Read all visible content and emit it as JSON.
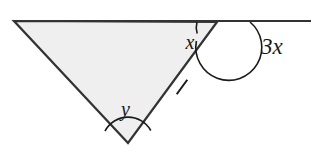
{
  "figure": {
    "kind": "geometry-diagram",
    "width": 322,
    "height": 153,
    "background_color": "#ffffff",
    "fill_color": "#efefef",
    "stroke_color": "#333333",
    "label_color": "#1a1a1a"
  },
  "labels": {
    "interior_angle_right": "x",
    "exterior_angle_right": "3x",
    "apex_angle_bottom": "y"
  },
  "geometry": {
    "triangle": {
      "vertex_top_left": {
        "x": 14,
        "y": 21
      },
      "vertex_top_right": {
        "x": 217,
        "y": 22
      },
      "vertex_bottom": {
        "x": 128,
        "y": 143
      },
      "points": "14,21 217,22 128,143"
    },
    "extended_line": {
      "from": {
        "x": 14,
        "y": 21
      },
      "to": {
        "x": 311,
        "y": 21
      }
    },
    "tick_marks": [
      {
        "name": "tick-left-side",
        "cx": 70,
        "cy": 85,
        "angle_deg": 59
      },
      {
        "name": "tick-right-side",
        "cx": 182,
        "cy": 87,
        "angle_deg": -54
      }
    ],
    "arcs": {
      "angle_x": {
        "cx": 217,
        "cy": 22,
        "radius": 20
      },
      "angle_3x": {
        "cx": 217,
        "cy": 22,
        "radius": 33
      },
      "angle_y": {
        "cx": 128,
        "cy": 143,
        "radius": 26
      }
    },
    "label_positions": {
      "x": {
        "x": 190,
        "y": 49
      },
      "3x": {
        "x": 261,
        "y": 54
      },
      "y": {
        "x": 121,
        "y": 116
      }
    }
  }
}
